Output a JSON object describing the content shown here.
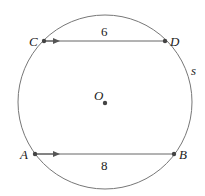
{
  "diagram": {
    "type": "circle-with-parallel-chords",
    "colors": {
      "circle_stroke": "#777777",
      "chord_stroke": "#666666",
      "point_fill": "#444444",
      "text": "#222222"
    },
    "circle": {
      "center_label": "O",
      "arc_label": "s",
      "cx": 105,
      "cy": 102,
      "r": 87
    },
    "points": {
      "C": {
        "label": "C",
        "x": 44,
        "y": 41
      },
      "D": {
        "label": "D",
        "x": 165,
        "y": 41
      },
      "A": {
        "label": "A",
        "x": 35,
        "y": 154
      },
      "B": {
        "label": "B",
        "x": 174,
        "y": 154
      },
      "O": {
        "label": "O",
        "x": 105,
        "y": 102
      }
    },
    "chords": [
      {
        "name": "CD",
        "length_label": "6",
        "from": "C",
        "to": "D",
        "arrow": "right"
      },
      {
        "name": "AB",
        "length_label": "8",
        "from": "A",
        "to": "B",
        "arrow": "right"
      }
    ]
  }
}
